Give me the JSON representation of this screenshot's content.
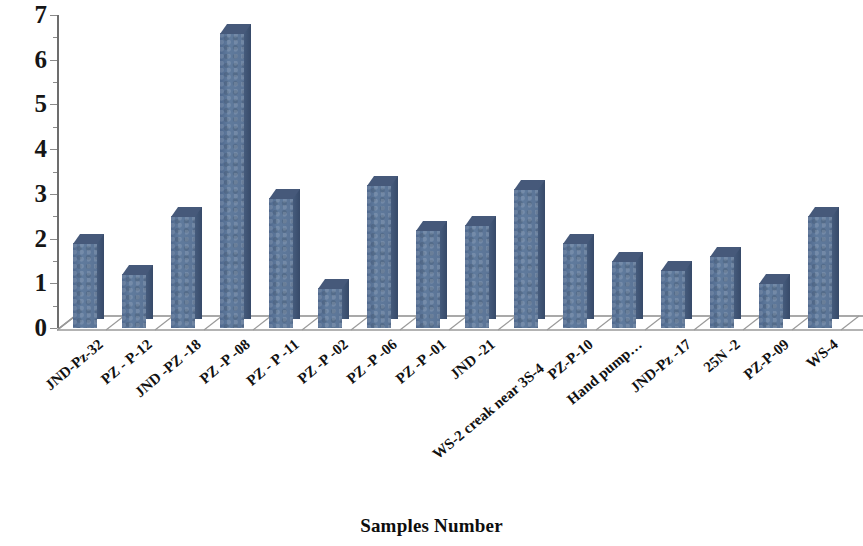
{
  "chart_data": {
    "type": "bar",
    "title": "",
    "subtitle": "",
    "xlabel": "Samples Number",
    "ylabel": "",
    "ylim": [
      0,
      7
    ],
    "y_ticks": [
      0,
      1,
      2,
      3,
      4,
      5,
      6,
      7
    ],
    "grid": false,
    "legend": false,
    "legend_position": "none",
    "style": "3d-column",
    "bar_color": "#5a7296",
    "bar_side_color": "#3f5475",
    "bar_top_color": "#46597a",
    "axis_color": "#6d6d6d",
    "categories": [
      "JND-Pz-32",
      "PZ - P-12",
      "JND -PZ -18",
      "PZ -P -08",
      "PZ - P -11",
      "PZ -P -02",
      "PZ -P -06",
      "PZ -P -01",
      "JND -21",
      "WS-2 creak near 3S-4",
      "PZ-P-10",
      "Hand pump…",
      "JND-Pz -17",
      "25N -2",
      "PZ-P-09",
      "WS-4"
    ],
    "values": [
      1.9,
      1.2,
      2.5,
      6.6,
      2.9,
      0.9,
      3.2,
      2.2,
      2.3,
      3.1,
      1.9,
      1.5,
      1.3,
      1.6,
      1.0,
      2.5
    ]
  }
}
